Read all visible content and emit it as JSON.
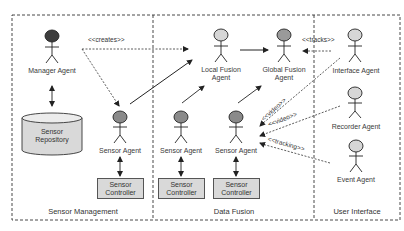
{
  "zones": {
    "sensor_management": "Sensor Management",
    "data_fusion": "Data Fusion",
    "user_interface": "User Interface"
  },
  "actors": {
    "manager": {
      "name": "Manager Agent",
      "head_color": "#3d3d3d"
    },
    "sensor_sm": {
      "name": "Sensor Agent",
      "head_color": "#8a8a8a"
    },
    "local_fusion": {
      "line1": "Local Fusion",
      "line2": "Agent",
      "head_color": "#d6d6d6"
    },
    "global_fusion": {
      "line1": "Global Fusion",
      "line2": "Agent",
      "head_color": "#9a9a9a"
    },
    "sensor_df1": {
      "name": "Sensor Agent",
      "head_color": "#8a8a8a"
    },
    "sensor_df2": {
      "name": "Sensor Agent",
      "head_color": "#8a8a8a"
    },
    "interface": {
      "name": "Interface Agent",
      "head_color": "#d6d6d6"
    },
    "recorder": {
      "name": "Recorder Agent",
      "head_color": "#d6d6d6"
    },
    "event": {
      "name": "Event Agent",
      "head_color": "#d6d6d6"
    }
  },
  "repository": {
    "line1": "Sensor",
    "line2": "Repository",
    "fill": "#d9d9d9"
  },
  "controllers": [
    {
      "line1": "Sensor",
      "line2": "Controller"
    },
    {
      "line1": "Sensor",
      "line2": "Controller"
    },
    {
      "line1": "Sensor",
      "line2": "Controller"
    }
  ],
  "relations": {
    "creates": "<<creates>>",
    "tracks": "<<tracks>>",
    "video1": "<<video>>",
    "video2": "<<video>>",
    "tracking": "<<tracking>>"
  }
}
